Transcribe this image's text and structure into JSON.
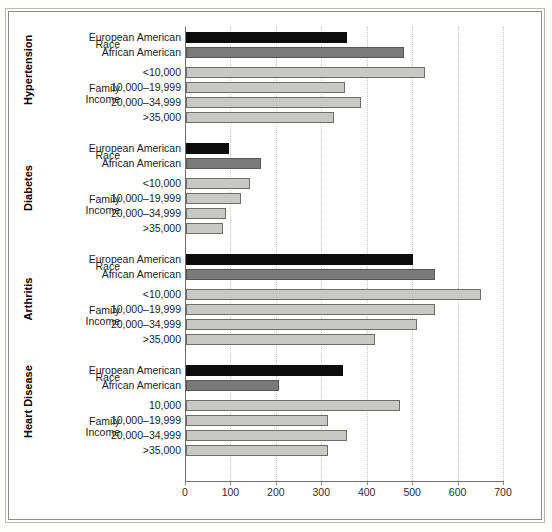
{
  "chart_data": {
    "type": "bar",
    "orientation": "horizontal",
    "title": "",
    "xlabel": "",
    "ylabel": "",
    "xlim": [
      0,
      700
    ],
    "xticks": [
      0,
      100,
      200,
      300,
      400,
      500,
      600,
      700
    ],
    "xtick_labels": [
      "0",
      "100",
      "200",
      "300",
      "400",
      "500",
      "600",
      "700"
    ],
    "grid": "vertical-dotted",
    "legend": "none",
    "series_colors": {
      "european_american": "#0d0d0d",
      "african_american": "#7a7a7a",
      "family_income": "#c8c8c4"
    },
    "groups": [
      {
        "name": "Hypertension",
        "subgroups": [
          {
            "label": "Race",
            "rows": [
              {
                "category": "European American",
                "value": 355,
                "style": "black"
              },
              {
                "category": "African American",
                "value": 480,
                "style": "dark"
              }
            ]
          },
          {
            "label": "Family Income",
            "label_line1": "Family",
            "label_line2": "Income",
            "rows": [
              {
                "category": "<10,000",
                "value": 525,
                "style": "light"
              },
              {
                "category": "10,000–19,999",
                "value": 350,
                "style": "light"
              },
              {
                "category": "20,000–34,999",
                "value": 385,
                "style": "light"
              },
              {
                "category": ">35,000",
                "value": 325,
                "style": "light"
              }
            ]
          }
        ]
      },
      {
        "name": "Diabetes",
        "subgroups": [
          {
            "label": "Race",
            "rows": [
              {
                "category": "European American",
                "value": 95,
                "style": "black"
              },
              {
                "category": "African American",
                "value": 165,
                "style": "dark"
              }
            ]
          },
          {
            "label": "Family Income",
            "label_line1": "Family",
            "label_line2": "Income",
            "rows": [
              {
                "category": "<10,000",
                "value": 140,
                "style": "light"
              },
              {
                "category": "10,000–19,999",
                "value": 120,
                "style": "light"
              },
              {
                "category": "20,000–34,999",
                "value": 88,
                "style": "light"
              },
              {
                "category": ">35,000",
                "value": 82,
                "style": "light"
              }
            ]
          }
        ]
      },
      {
        "name": "Arthritis",
        "subgroups": [
          {
            "label": "Race",
            "rows": [
              {
                "category": "European American",
                "value": 500,
                "style": "black"
              },
              {
                "category": "African American",
                "value": 548,
                "style": "dark"
              }
            ]
          },
          {
            "label": "Family Income",
            "label_line1": "Family",
            "label_line2": "Income",
            "rows": [
              {
                "category": "<10,000",
                "value": 650,
                "style": "light"
              },
              {
                "category": "10,000–19,999",
                "value": 548,
                "style": "light"
              },
              {
                "category": "20,000–34,999",
                "value": 508,
                "style": "light"
              },
              {
                "category": ">35,000",
                "value": 415,
                "style": "light"
              }
            ]
          }
        ]
      },
      {
        "name": "Heart Disease",
        "subgroups": [
          {
            "label": "Race",
            "rows": [
              {
                "category": "European American",
                "value": 345,
                "style": "black"
              },
              {
                "category": "African American",
                "value": 205,
                "style": "dark"
              }
            ]
          },
          {
            "label": "Family Income",
            "label_line1": "Family",
            "label_line2": "Income",
            "rows": [
              {
                "category": "10,000",
                "value": 472,
                "style": "light"
              },
              {
                "category": "10,000–19,999",
                "value": 312,
                "style": "light"
              },
              {
                "category": "20,000–34,999",
                "value": 355,
                "style": "light"
              },
              {
                "category": ">35,000",
                "value": 312,
                "style": "light"
              }
            ]
          }
        ]
      }
    ]
  }
}
